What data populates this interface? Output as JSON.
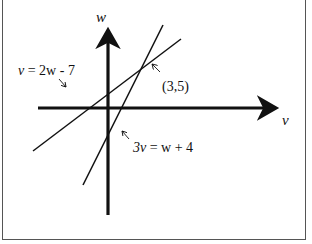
{
  "diagram": {
    "axes": {
      "horizontal_label": "v",
      "vertical_label": "w"
    },
    "lines": [
      {
        "id": "line-1",
        "equation_lhs": "v",
        "equation_rhs": "= 2w - 7",
        "equation": "v = 2w - 7",
        "x1": 33,
        "y1": 151,
        "x2": 181,
        "y2": 39
      },
      {
        "id": "line-2",
        "equation_lhs": "3v",
        "equation_rhs": "= w + 4",
        "equation": "3v = w + 4",
        "x1": 83,
        "y1": 185,
        "x2": 163,
        "y2": 25
      }
    ],
    "intersection": {
      "label": "(3,5)"
    },
    "colors": {
      "ink": "#111111",
      "frame": "#555555",
      "background": "#ffffff"
    }
  }
}
